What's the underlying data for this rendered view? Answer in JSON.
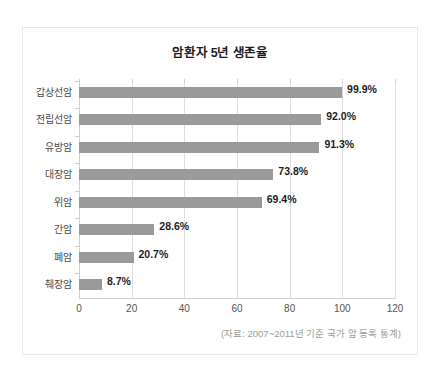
{
  "card": {
    "title": "암환자 5년 생존율",
    "source_note": "(자료: 2007~2011년 기준 국가 암 등록 통계)"
  },
  "chart_data": {
    "type": "bar",
    "orientation": "horizontal",
    "title": "암환자 5년 생존율",
    "xlabel": "",
    "ylabel": "",
    "xlim": [
      0,
      120
    ],
    "xticks": [
      0,
      20,
      40,
      60,
      80,
      100,
      120
    ],
    "grid": true,
    "legend": false,
    "bar_color": "#9a9a9a",
    "categories": [
      "갑상선암",
      "전립선암",
      "유방암",
      "대장암",
      "위암",
      "간암",
      "폐암",
      "췌장암"
    ],
    "values": [
      99.9,
      92.0,
      91.3,
      73.8,
      69.4,
      28.6,
      20.7,
      8.7
    ],
    "value_labels": [
      "99.9%",
      "92.0%",
      "91.3%",
      "73.8%",
      "69.4%",
      "28.6%",
      "20.7%",
      "8.7%"
    ],
    "annotation": "(자료: 2007~2011년 기준 국가 암 등록 통계)"
  }
}
